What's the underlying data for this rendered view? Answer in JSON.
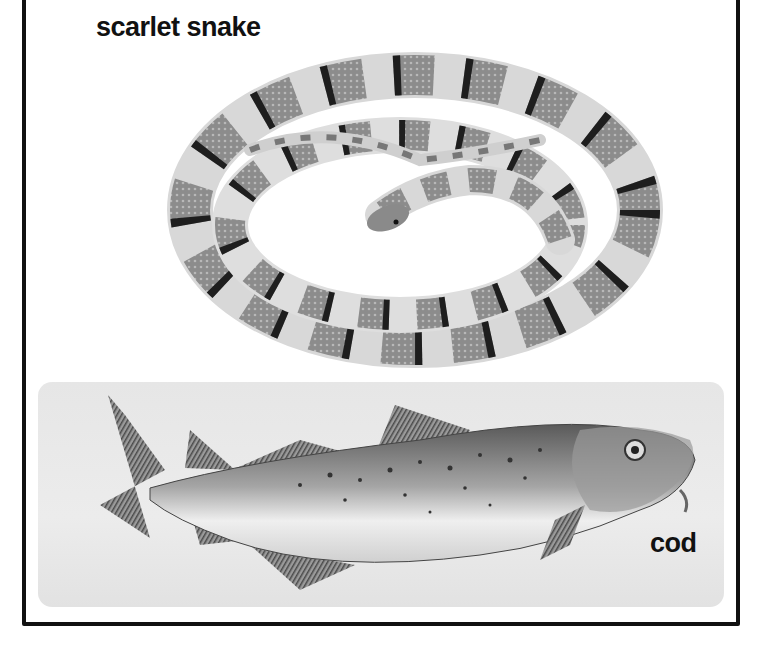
{
  "labels": {
    "snake": "scarlet snake",
    "fish": "cod"
  },
  "illustrations": [
    {
      "subject": "scarlet snake",
      "style": "grayscale drawing, coiled, banded"
    },
    {
      "subject": "cod",
      "style": "grayscale drawing, spotted, on light gray panel"
    }
  ],
  "colors": {
    "border": "#111111",
    "panel": "#e6e6e6",
    "band_dark": "#1e1e1e",
    "band_mid": "#8a8a8a"
  }
}
